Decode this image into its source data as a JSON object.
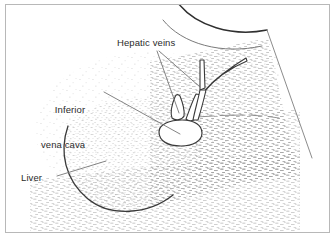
{
  "figure": {
    "kind": "ultrasound-line-drawing",
    "border_color": "#b8b8b8",
    "ink_color": "#2b2b2b",
    "speckle_color": "#9a9a9a",
    "background": "#ffffff"
  },
  "labels": {
    "hepatic_veins": "Hepatic veins",
    "inferior_vena_cava_line1": "Inferior",
    "inferior_vena_cava_line2": "vena cava",
    "liver": "Liver"
  },
  "structures": [
    {
      "name": "transducer-arc-outer",
      "label": "Hepatic veins"
    },
    {
      "name": "liver-outline",
      "label": "Liver"
    },
    {
      "name": "inferior-vena-cava-oval",
      "label": "Inferior vena cava"
    },
    {
      "name": "hepatic-vein-branches",
      "label": "Hepatic veins"
    }
  ]
}
